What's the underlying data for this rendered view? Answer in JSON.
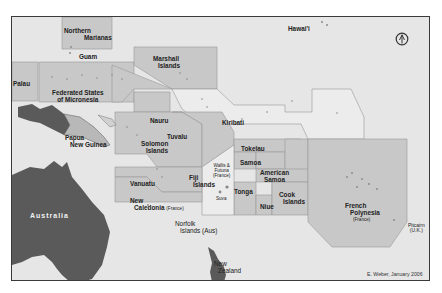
{
  "map": {
    "title": "Pacific Island Countries and Territories",
    "credit": "E. Weber, January 2006",
    "colors": {
      "ocean": "#e6e6e6",
      "eez_zone": "#c8c8c8",
      "eez_light": "#ececec",
      "landmass": "#5a5a5a",
      "png_highlight": "#b8b8b8",
      "border": "#3a3a3a"
    },
    "compass_icon": "north-arrow-icon",
    "labels": {
      "northern_marianas": [
        "Northern",
        "Marianas"
      ],
      "guam": "Guam",
      "hawaii": "Hawai'i",
      "palau": "Palau",
      "marshall_islands": [
        "Marshall",
        "Islands"
      ],
      "fsm": [
        "Federated States",
        "of Micronesia"
      ],
      "nauru": "Nauru",
      "kiribati": "Kiribati",
      "papua_new_guinea": [
        "Papua",
        "New Guinea"
      ],
      "tuvalu": "Tuvalu",
      "tokelau": "Tokelau",
      "solomon_islands": [
        "Solomon",
        "Islands"
      ],
      "wallis_futuna": [
        "Wallis &",
        "Futuna",
        "(France)"
      ],
      "samoa": "Samoa",
      "american_samoa": [
        "American",
        "Samoa"
      ],
      "fiji": [
        "Fiji",
        "Islands"
      ],
      "suva": "Suva",
      "vanuatu": "Vanuatu",
      "tonga": "Tonga",
      "cook_islands": [
        "Cook",
        "Islands"
      ],
      "niue": "Niue",
      "new_caledonia": [
        "New",
        "Caledonia",
        "(France)"
      ],
      "french_polynesia": [
        "French",
        "Polynesia",
        "(France)"
      ],
      "australia": "Australia",
      "norfolk": [
        "Norfolk",
        "Islands (Aus)"
      ],
      "pitcairn": [
        "Pitcairn",
        "(U.K.)"
      ],
      "new_zealand": [
        "New",
        "Zealand"
      ]
    }
  }
}
